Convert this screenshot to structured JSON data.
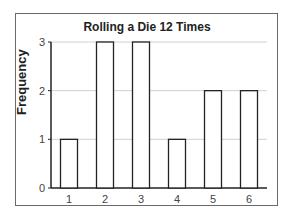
{
  "chart_data": {
    "type": "bar",
    "title": "Rolling a Die 12 Times",
    "xlabel": "",
    "ylabel": "Frequency",
    "categories": [
      "1",
      "2",
      "3",
      "4",
      "5",
      "6"
    ],
    "values": [
      1,
      3,
      3,
      1,
      2,
      2
    ],
    "ylim": [
      0,
      3
    ],
    "yticks": [
      0,
      1,
      2,
      3
    ],
    "grid": true,
    "legend": null,
    "colors": {
      "bar_fill": "#ffffff",
      "bar_stroke": "#222222",
      "grid": "#d0d0d0",
      "frame": "#6a6a6a"
    }
  }
}
